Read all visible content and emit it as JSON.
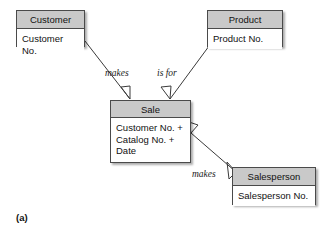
{
  "figure": {
    "caption": "(a)",
    "colors": {
      "header_fill": "#c9c9c9",
      "body_fill": "#ffffff",
      "border": "#4a4a4a",
      "line": "#3a3a3a",
      "text": "#111111"
    }
  },
  "entities": [
    {
      "id": "customer",
      "title": "Customer",
      "attributes": "Customer No.",
      "x": 16,
      "y": 10,
      "w": 69,
      "h": 37,
      "header_h": 18
    },
    {
      "id": "product",
      "title": "Product",
      "attributes": "Product No.",
      "x": 207,
      "y": 10,
      "w": 76,
      "h": 37,
      "header_h": 18
    },
    {
      "id": "sale",
      "title": "Sale",
      "attributes": "Customer No. +\nCatalog No. +\nDate",
      "x": 110,
      "y": 100,
      "w": 81,
      "h": 63,
      "header_h": 17
    },
    {
      "id": "salesperson",
      "title": "Salesperson",
      "attributes": "Salesperson No.",
      "x": 232,
      "y": 167,
      "w": 84,
      "h": 38,
      "header_h": 18
    }
  ],
  "relationships": [
    {
      "id": "customer-makes-sale",
      "label": "makes",
      "from": "customer",
      "to": "sale",
      "label_x": 105,
      "label_y": 69
    },
    {
      "id": "sale-is-for-product",
      "label": "is for",
      "from": "sale",
      "to": "product",
      "label_x": 157,
      "label_y": 69
    },
    {
      "id": "salesperson-makes-sale",
      "label": "makes",
      "from": "sale",
      "to": "salesperson",
      "label_x": 192,
      "label_y": 170
    }
  ]
}
